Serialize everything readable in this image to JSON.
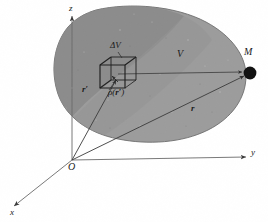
{
  "figure": {
    "kind": "physics-diagram",
    "caption": "",
    "background_color": "#ffffff",
    "body_fill_light": "#9b9b9b",
    "body_fill_dark": "#828282",
    "body_outline": "#6f6f6f",
    "line_color": "#3a3a3a",
    "ink_color": "#1a1a1a"
  },
  "axes": {
    "origin": {
      "label": "O",
      "x": 72,
      "y": 160
    },
    "z": {
      "label": "z",
      "x": 74,
      "y": 10,
      "tip_x": 72,
      "tip_y": 14
    },
    "y": {
      "label": "y",
      "x": 253,
      "y": 154,
      "tip_x": 248,
      "tip_y": 155
    },
    "x": {
      "label": "x",
      "x": 13,
      "y": 215,
      "tip_x": 12,
      "tip_y": 207
    }
  },
  "body": {
    "label": "V",
    "label_x": 178,
    "label_y": 54
  },
  "volume_element": {
    "label": "ΔV",
    "label_x": 112,
    "label_y": 46,
    "cube_left": 100,
    "cube_top": 57,
    "cube_width": 36,
    "cube_height": 32
  },
  "density": {
    "label_rho": "ρ(",
    "label_vector": "r",
    "label_prime": "′",
    "label_close": ")",
    "x": 110,
    "y": 92
  },
  "source_vector": {
    "label": "r",
    "prime": "′",
    "x": 84,
    "y": 86
  },
  "field_vector": {
    "label": "r",
    "x": 192,
    "y": 106
  },
  "field_point": {
    "label": "M",
    "label_x": 247,
    "label_y": 54,
    "dot_x": 250,
    "dot_y": 73,
    "dot_r": 6
  },
  "icons": {
    "arrowhead": "arrowhead-icon",
    "filled-dot": "filled-dot-icon"
  }
}
